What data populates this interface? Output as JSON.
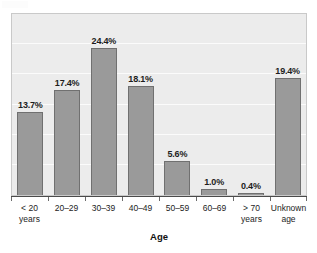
{
  "chart_data": {
    "type": "bar",
    "title": "",
    "subtitle": "",
    "xlabel": "Age",
    "ylabel": "",
    "categories": [
      "< 20 years",
      "20–29",
      "30–39",
      "40–49",
      "50–59",
      "60–69",
      "> 70 years",
      "Unknown age"
    ],
    "category_lines": [
      [
        "< 20",
        "years"
      ],
      [
        "20–29"
      ],
      [
        "30–39"
      ],
      [
        "40–49"
      ],
      [
        "50–59"
      ],
      [
        "60–69"
      ],
      [
        "> 70",
        "years"
      ],
      [
        "Unknown",
        "age"
      ]
    ],
    "values": [
      13.7,
      17.4,
      24.4,
      18.1,
      5.6,
      1.0,
      0.4,
      19.4
    ],
    "value_labels": [
      "13.7%",
      "17.4%",
      "24.4%",
      "18.1%",
      "5.6%",
      "1.0%",
      "0.4%",
      "19.4%"
    ],
    "unit": "%",
    "ylim": [
      0,
      30
    ],
    "y_gridline_values": [
      5,
      10,
      15,
      20,
      25
    ],
    "grid": true,
    "y_axis_visible": false,
    "y_tick_labels_visible": false,
    "legend": false,
    "legend_position": "none",
    "bar_color": "#9a9a9a",
    "bar_border_color": "#707070",
    "plot_background_color": "#ececec",
    "gridline_color": "#fbfbfb",
    "axis_color": "#4a4a4a",
    "text_color": "#1d1d1d",
    "figure_background_color": "#ffffff"
  }
}
